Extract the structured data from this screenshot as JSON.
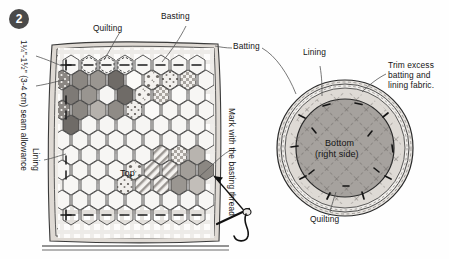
{
  "figure": {
    "step_number": "2",
    "alt": "Quilting diagram: hexagon patchwork top with basting and quilting, and a circular bottom piece"
  },
  "labels": {
    "seam_allowance": "1¼\"-1½\" (3-4 cm) seam allowance",
    "lining_left": "Lining",
    "quilting_top": "Quilting",
    "basting": "Basting",
    "batting": "Batting",
    "lining_circle": "Lining",
    "trim": "Trim excess batting and lining fabric.",
    "mark_thread": "Mark with the basting thread",
    "top": "Top",
    "bottom": "Bottom",
    "bottom_side": "(right side)",
    "quilting_bottom": "Quilting"
  },
  "colors": {
    "ink": "#141414",
    "badge": "#4a4a4a",
    "fabric_light": "#f3f1ee",
    "fabric_mid": "#cfcbc6",
    "fabric_dark": "#8f8b86",
    "fabric_darker": "#6e6a66",
    "batting": "#e6e3de",
    "lining": "#d8d4cf",
    "bottom_fill": "#a7a3a0"
  }
}
